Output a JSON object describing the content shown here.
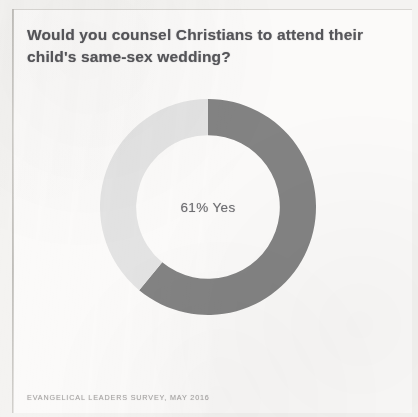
{
  "card": {
    "title": "Would you counsel Christians to attend their child's same-sex wedding?",
    "source_caption": "EVANGELICAL LEADERS SURVEY, MAY 2016",
    "center_label": "61% Yes"
  },
  "colors": {
    "yes": "#808080",
    "no": "#e3e3e3",
    "title_text": "#56565a",
    "center_text": "#6e6e72",
    "caption_text": "#a9a7a6",
    "card_background": "#fbfaf9",
    "page_background": "#f4f3f1"
  },
  "chart_data": {
    "type": "pie",
    "title": "Would you counsel Christians to attend their child's same-sex wedding?",
    "subtitle": "",
    "xlabel": "",
    "ylabel": "",
    "donut": true,
    "inner_radius_ratio": 0.665,
    "start_angle_deg": 0,
    "direction": "clockwise",
    "legend": "none",
    "grid": false,
    "center_annotation": "61% Yes",
    "annotations": [
      "61% Yes"
    ],
    "labels": [
      "Yes",
      "No"
    ],
    "values": [
      61,
      39
    ],
    "units": "percent",
    "slices": [
      {
        "name": "Yes",
        "value": 61,
        "color": "#808080",
        "start_deg": 0,
        "end_deg": 219.6
      },
      {
        "name": "No",
        "value": 39,
        "color": "#e3e3e3",
        "start_deg": 219.6,
        "end_deg": 360
      }
    ],
    "source": "EVANGELICAL LEADERS SURVEY, MAY 2016"
  }
}
